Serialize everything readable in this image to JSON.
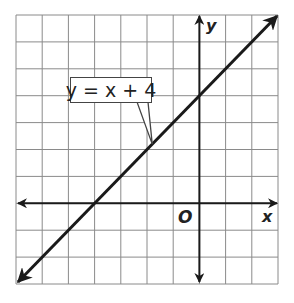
{
  "chart_data": {
    "type": "line",
    "title": "",
    "equation_label": "y = x + 4",
    "xlabel": "x",
    "ylabel": "y",
    "origin_label": "O",
    "xlim": [
      -7,
      3
    ],
    "ylim": [
      -3,
      7
    ],
    "grid": true,
    "grid_step": 1,
    "tick_labels": false,
    "series": [
      {
        "name": "y = x + 4",
        "slope": 1,
        "intercept": 4,
        "x": [
          -7,
          -4,
          0,
          3
        ],
        "y": [
          -3,
          0,
          4,
          7
        ],
        "arrows": "both"
      }
    ],
    "annotations": [
      {
        "text": "y = x + 4",
        "points_to": [
          -1.8,
          2.2
        ]
      }
    ],
    "colors": {
      "line": "#1a1a1a",
      "grid": "#8a8a8a",
      "axis": "#1a1a1a"
    }
  }
}
